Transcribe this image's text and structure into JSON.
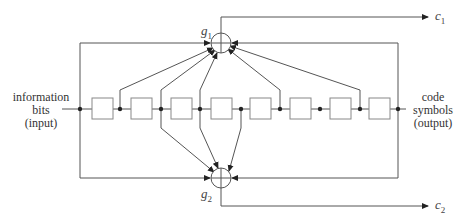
{
  "diagram": {
    "type": "convolutional-encoder",
    "input_label": [
      "information",
      "bits",
      "(input)"
    ],
    "output_label": [
      "code",
      "symbols",
      "(output)"
    ],
    "register_count": 8,
    "adders": [
      {
        "id": "g1",
        "symbol": "g",
        "subscript": "1",
        "output": {
          "symbol": "c",
          "subscript": "1"
        },
        "taps": [
          0,
          1,
          2,
          3,
          5,
          7,
          8
        ]
      },
      {
        "id": "g2",
        "symbol": "g",
        "subscript": "2",
        "output": {
          "symbol": "c",
          "subscript": "2"
        },
        "taps": [
          0,
          2,
          3,
          4,
          8
        ]
      }
    ],
    "line_color": "#555555",
    "box_color": "#888888"
  }
}
